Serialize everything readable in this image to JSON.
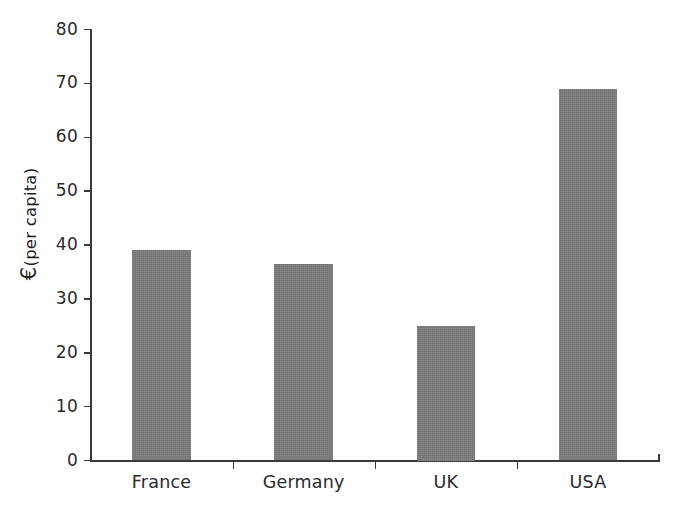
{
  "chart_data": {
    "type": "bar",
    "title": "",
    "xlabel": "",
    "ylabel": "€ (per capita)",
    "ylabel_parts": {
      "symbol": "€",
      "qualifier": "(per capita)"
    },
    "categories": [
      "France",
      "Germany",
      "UK",
      "USA"
    ],
    "values": [
      39,
      36.5,
      25,
      69
    ],
    "ylim": [
      0,
      80
    ],
    "yticks": [
      0,
      10,
      20,
      30,
      40,
      50,
      60,
      70,
      80
    ],
    "ytick_labels": [
      "0",
      "10",
      "20",
      "30",
      "40",
      "50",
      "60",
      "70",
      "80"
    ],
    "grid": false,
    "legend": null,
    "series": [
      {
        "name": "",
        "values": [
          39,
          36.5,
          25,
          69
        ],
        "color": "#7a7a7a"
      }
    ]
  },
  "colors": {
    "bar_fill": "#7a7a7a",
    "axis": "#3a3a3a",
    "text": "#2a2a2a",
    "background": "#ffffff"
  }
}
